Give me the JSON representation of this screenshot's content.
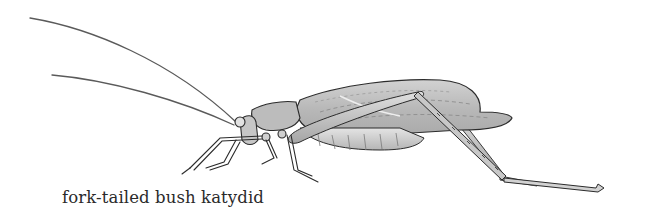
{
  "figure": {
    "caption": "fork-tailed bush katydid",
    "colors": {
      "background": "#ffffff",
      "outline": "#2b2b2b",
      "body_fill": "#bdbdbd",
      "wing_fill": "#c4c4c4",
      "abdomen_fill": "#d6d6d6",
      "highlight": "#e6e6e6"
    }
  }
}
